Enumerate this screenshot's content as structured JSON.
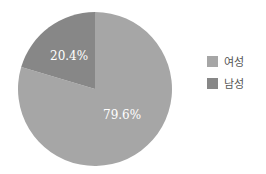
{
  "chart_data": {
    "type": "pie",
    "title": "",
    "categories": [
      "여성",
      "남성"
    ],
    "values": [
      79.6,
      20.4
    ],
    "labels": [
      "79.6%",
      "20.4%"
    ],
    "colors": [
      "#a6a6a6",
      "#878787"
    ],
    "legend_position": "right"
  },
  "legend": {
    "items": [
      {
        "label": "여성",
        "color": "#a6a6a6"
      },
      {
        "label": "남성",
        "color": "#878787"
      }
    ]
  }
}
